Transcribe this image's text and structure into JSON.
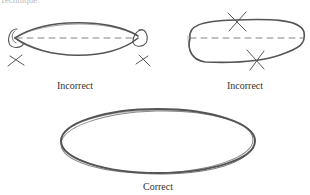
{
  "figure": {
    "top_fragment": "Technique:",
    "panels": [
      {
        "id": "left",
        "label": "Incorrect",
        "shape": "pointed lens with circled ends",
        "marks": [
          "x-mark at left end",
          "x-mark at right end"
        ]
      },
      {
        "id": "right",
        "label": "Incorrect",
        "shape": "flattened oblong",
        "marks": [
          "x-mark at top edge",
          "x-mark at bottom edge"
        ]
      },
      {
        "id": "bottom",
        "label": "Correct",
        "shape": "smooth ellipse"
      }
    ],
    "colors": {
      "stroke": "#555555",
      "dash": "#777777",
      "text": "#333333"
    }
  }
}
